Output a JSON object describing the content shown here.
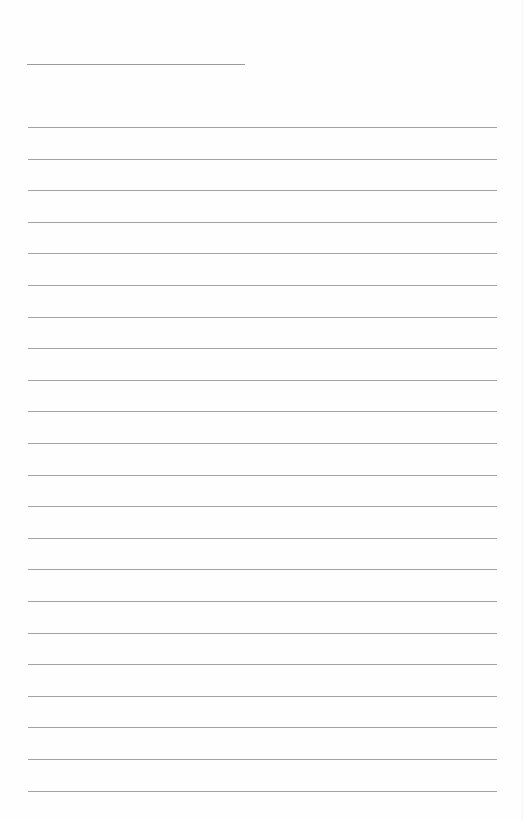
{
  "page": {
    "type": "lined-paper",
    "background_color": "#fefefe",
    "line_color": "#a3a3a3"
  },
  "header_line": {
    "x": 27,
    "y": 64,
    "width": 218
  },
  "ruled_lines": {
    "count": 22,
    "first_y": 127,
    "spacing": 31.6,
    "x": 28,
    "width": 469
  }
}
